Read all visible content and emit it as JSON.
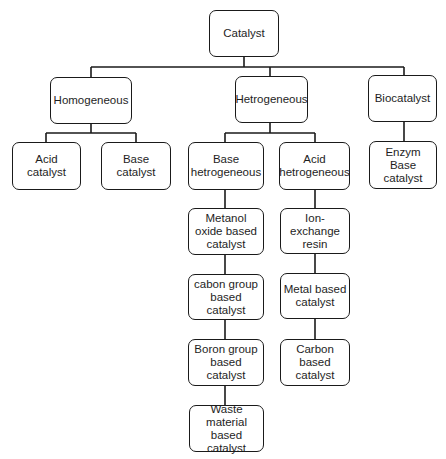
{
  "diagram": {
    "type": "hierarchy-tree",
    "root": {
      "label": "Catalyst",
      "children": [
        {
          "label": "Homogeneous",
          "children": [
            {
              "label": "Acid catalyst"
            },
            {
              "label": "Base catalyst"
            }
          ]
        },
        {
          "label": "Hetrogeneous",
          "children": [
            {
              "label": "Base\nhetrogeneous",
              "children": [
                {
                  "label": "Metanol\noxide based\ncatalyst"
                },
                {
                  "label": "cabon group\nbased catalyst"
                },
                {
                  "label": "Boron group\nbased catalyst"
                },
                {
                  "label": "Waste\nmaterial based\ncatalyst"
                }
              ]
            },
            {
              "label": "Acid\nhetrogeneous",
              "children": [
                {
                  "label": "Ion-exchange\nresin"
                },
                {
                  "label": "Metal based\ncatalyst"
                },
                {
                  "label": "Carbon based\ncatalyst"
                }
              ]
            }
          ]
        },
        {
          "label": "Biocatalyst",
          "children": [
            {
              "label": "Enzym Base\ncatalyst"
            }
          ]
        }
      ]
    }
  },
  "nodes": {
    "catalyst": "Catalyst",
    "homogeneous": "Homogeneous",
    "hetrogeneous": "Hetrogeneous",
    "biocatalyst": "Biocatalyst",
    "acid_catalyst": "Acid catalyst",
    "base_catalyst": "Base catalyst",
    "base_hetrogeneous": "Base\nhetrogeneous",
    "acid_hetrogeneous": "Acid\nhetrogeneous",
    "enzym_base_catalyst": "Enzym Base\ncatalyst",
    "metanol_oxide": "Metanol\noxide based\ncatalyst",
    "cabon_group": "cabon group\nbased catalyst",
    "boron_group": "Boron group\nbased catalyst",
    "waste_material": "Waste\nmaterial based\ncatalyst",
    "ion_exchange": "Ion-exchange\nresin",
    "metal_based": "Metal based\ncatalyst",
    "carbon_based": "Carbon based\ncatalyst"
  },
  "colors": {
    "line": "#1a1a1a",
    "background": "#ffffff",
    "text": "#1e1e1e"
  }
}
